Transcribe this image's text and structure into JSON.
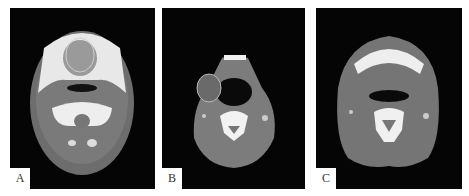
{
  "figure": {
    "panels": [
      {
        "id": "A",
        "label": "A",
        "description": "Axial CT slice at oral cavity level; circled lesion in anterior tongue/floor of mouth"
      },
      {
        "id": "B",
        "label": "B",
        "description": "Axial CT slice at oropharynx level; circled lesion at right lateral neck"
      },
      {
        "id": "C",
        "label": "C",
        "description": "Axial CT slice at mandible/hyoid level"
      }
    ]
  }
}
